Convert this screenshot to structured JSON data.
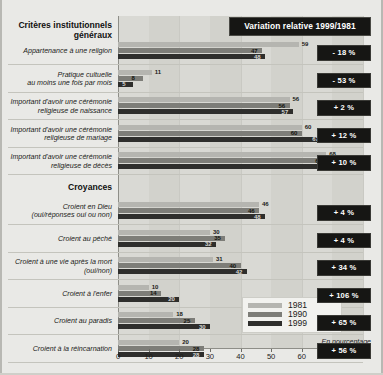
{
  "banner": {
    "label": "Variation relative 1999/1981"
  },
  "legend": {
    "items": [
      {
        "year": "1981",
        "color": "#b5b5b0"
      },
      {
        "year": "1990",
        "color": "#7d7d78"
      },
      {
        "year": "1999",
        "color": "#2e2e2c"
      }
    ]
  },
  "unit_note": "En pourcentage",
  "group_headings": [
    {
      "line1": "Critères institutionnels",
      "line2": "généraux"
    },
    {
      "line1": "Croyances",
      "line2": ""
    }
  ],
  "axis": {
    "ticks": [
      "0",
      "10",
      "20",
      "30",
      "40",
      "50",
      "60",
      "70",
      "80"
    ],
    "min": 0,
    "max": 80
  },
  "rows": [
    {
      "label_lines": [
        "Appartenance à une religion"
      ],
      "values": [
        59,
        47,
        48
      ],
      "variation": "- 18 %"
    },
    {
      "label_lines": [
        "Pratique cultuelle",
        "au moins une fois par mois"
      ],
      "values": [
        11,
        8,
        5
      ],
      "variation": "- 53 %"
    },
    {
      "label_lines": [
        "Important d'avoir une cérémonie",
        "religieuse de naissance"
      ],
      "values": [
        56,
        56,
        57
      ],
      "variation": "+ 2 %"
    },
    {
      "label_lines": [
        "Important d'avoir une cérémonie",
        "religieuse de mariage"
      ],
      "values": [
        60,
        60,
        67
      ],
      "variation": "+ 12 %"
    },
    {
      "label_lines": [
        "Important d'avoir une cérémonie",
        "religieuse de décès"
      ],
      "values": [
        68,
        68,
        75
      ],
      "variation": "+ 10 %"
    },
    {
      "label_lines": [
        "Croient en Dieu",
        "(oui/réponses oui ou non)"
      ],
      "values": [
        46,
        46,
        48
      ],
      "variation": "+ 4 %"
    },
    {
      "label_lines": [
        "Croient au péché"
      ],
      "values": [
        30,
        35,
        32
      ],
      "variation": "+ 4 %"
    },
    {
      "label_lines": [
        "Croient à une vie après la mort",
        "(oui/non)"
      ],
      "values": [
        31,
        40,
        42
      ],
      "variation": "+ 34 %"
    },
    {
      "label_lines": [
        "Croient à l'enfer"
      ],
      "values": [
        10,
        14,
        20
      ],
      "variation": "+ 106 %"
    },
    {
      "label_lines": [
        "Croient au paradis"
      ],
      "values": [
        18,
        25,
        30
      ],
      "variation": "+ 65 %"
    },
    {
      "label_lines": [
        "Croient à la réincarnation"
      ],
      "values": [
        20,
        28,
        28
      ],
      "variation": "+ 56 %"
    }
  ],
  "chart_data": {
    "type": "bar",
    "title": "Variation relative 1999/1981",
    "orientation": "horizontal",
    "grouped": true,
    "xlabel": "En pourcentage",
    "ylabel": "",
    "xlim": [
      0,
      80
    ],
    "xticks": [
      0,
      10,
      20,
      30,
      40,
      50,
      60,
      70,
      80
    ],
    "grid": true,
    "legend_position": "bottom-right",
    "series": [
      {
        "name": "1981",
        "color": "#b5b5b0",
        "values": [
          59,
          11,
          56,
          60,
          68,
          46,
          30,
          31,
          10,
          18,
          20
        ]
      },
      {
        "name": "1990",
        "color": "#7d7d78",
        "values": [
          47,
          8,
          56,
          60,
          68,
          46,
          35,
          40,
          14,
          25,
          28
        ]
      },
      {
        "name": "1999",
        "color": "#2e2e2c",
        "values": [
          48,
          5,
          57,
          67,
          75,
          48,
          32,
          42,
          20,
          30,
          28
        ]
      }
    ],
    "categories": [
      "Appartenance à une religion",
      "Pratique cultuelle au moins une fois par mois",
      "Important d'avoir une cérémonie religieuse de naissance",
      "Important d'avoir une cérémonie religieuse de mariage",
      "Important d'avoir une cérémonie religieuse de décès",
      "Croient en Dieu (oui/réponses oui ou non)",
      "Croient au péché",
      "Croient à une vie après la mort (oui/non)",
      "Croient à l'enfer",
      "Croient au paradis",
      "Croient à la réincarnation"
    ],
    "section_headings": [
      {
        "label": "Critères institutionnels généraux",
        "applies_to": [
          0,
          1,
          2,
          3,
          4
        ]
      },
      {
        "label": "Croyances",
        "applies_to": [
          5,
          6,
          7,
          8,
          9,
          10
        ]
      }
    ],
    "annotations": [
      {
        "category": "Appartenance à une religion",
        "variation_1999_1981": "- 18 %"
      },
      {
        "category": "Pratique cultuelle au moins une fois par mois",
        "variation_1999_1981": "- 53 %"
      },
      {
        "category": "Important d'avoir une cérémonie religieuse de naissance",
        "variation_1999_1981": "+ 2 %"
      },
      {
        "category": "Important d'avoir une cérémonie religieuse de mariage",
        "variation_1999_1981": "+ 12 %"
      },
      {
        "category": "Important d'avoir une cérémonie religieuse de décès",
        "variation_1999_1981": "+ 10 %"
      },
      {
        "category": "Croient en Dieu (oui/réponses oui ou non)",
        "variation_1999_1981": "+ 4 %"
      },
      {
        "category": "Croient au péché",
        "variation_1999_1981": "+ 4 %"
      },
      {
        "category": "Croient à une vie après la mort (oui/non)",
        "variation_1999_1981": "+ 34 %"
      },
      {
        "category": "Croient à l'enfer",
        "variation_1999_1981": "+ 106 %"
      },
      {
        "category": "Croient au paradis",
        "variation_1999_1981": "+ 65 %"
      },
      {
        "category": "Croient à la réincarnation",
        "variation_1999_1981": "+ 56 %"
      }
    ]
  }
}
